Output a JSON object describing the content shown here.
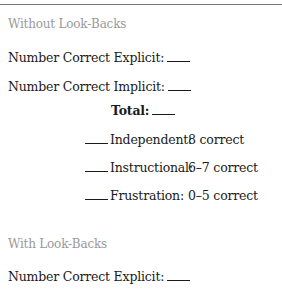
{
  "sections": [
    {
      "heading": "Without Look-Backs",
      "fields": [
        {
          "label": "Number Correct Explicit:",
          "value": ""
        },
        {
          "label": "Number Correct Implicit:",
          "value": ""
        }
      ],
      "total": {
        "label": "Total:",
        "value": ""
      },
      "levels": [
        {
          "name": "Independent:",
          "criteria": "8 correct"
        },
        {
          "name": "Instructional:",
          "criteria": "6–7 correct"
        },
        {
          "name": "Frustration:",
          "criteria": "0–5 correct"
        }
      ]
    },
    {
      "heading": "With Look-Backs",
      "fields": [
        {
          "label": "Number Correct Explicit:",
          "value": ""
        }
      ]
    }
  ]
}
